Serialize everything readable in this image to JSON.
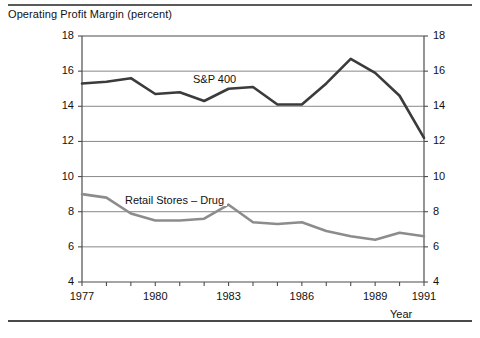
{
  "figure": {
    "title": "Operating Profit Margin (percent)",
    "x_axis_title": "Year",
    "top_rule": "horizontal-rule",
    "bottom_rule": "horizontal-rule"
  },
  "chart_data": {
    "type": "line",
    "title": "Operating Profit Margin (percent)",
    "xlabel": "Year",
    "ylabel": "Operating Profit Margin (percent)",
    "xlim": [
      1977,
      1991
    ],
    "ylim": [
      4,
      18
    ],
    "ytick_step": 2,
    "yticks": [
      4,
      6,
      8,
      10,
      12,
      14,
      16,
      18
    ],
    "ytick_labels_left": [
      "4",
      "6",
      "8",
      "10",
      "12",
      "14",
      "16",
      "18"
    ],
    "ytick_labels_right": [
      "4",
      "6",
      "8",
      "10",
      "12",
      "14",
      "16",
      "18"
    ],
    "xticks": [
      1977,
      1978,
      1979,
      1980,
      1981,
      1982,
      1983,
      1984,
      1985,
      1986,
      1987,
      1988,
      1989,
      1990,
      1991
    ],
    "xtick_labels_shown": [
      "1977",
      "1980",
      "1983",
      "1986",
      "1989",
      "1991"
    ],
    "grid": "horizontal-only",
    "legend_position": "inline-labels",
    "x": [
      1977,
      1978,
      1979,
      1980,
      1981,
      1982,
      1983,
      1984,
      1985,
      1986,
      1987,
      1988,
      1989,
      1990,
      1991
    ],
    "series": [
      {
        "name": "S&P 400",
        "label": "S&P 400",
        "color": "#3b3b3b",
        "width": 2.6,
        "values": [
          15.3,
          15.4,
          15.6,
          14.7,
          14.8,
          14.3,
          15.0,
          15.1,
          14.1,
          14.1,
          15.3,
          16.7,
          15.9,
          14.6,
          12.2
        ],
        "label_pos": {
          "x": 190,
          "y": 73
        }
      },
      {
        "name": "Retail Stores - Drug",
        "label": "Retail Stores – Drug",
        "color": "#8c8c8c",
        "width": 2.6,
        "values": [
          9.0,
          8.8,
          7.9,
          7.5,
          7.5,
          7.6,
          8.4,
          7.4,
          7.3,
          7.4,
          6.9,
          6.6,
          6.4,
          6.8,
          6.6
        ],
        "label_pos": {
          "x": 122,
          "y": 194
        }
      }
    ]
  },
  "plot_geometry": {
    "left": 82,
    "right": 424,
    "top": 36,
    "bottom": 282
  }
}
